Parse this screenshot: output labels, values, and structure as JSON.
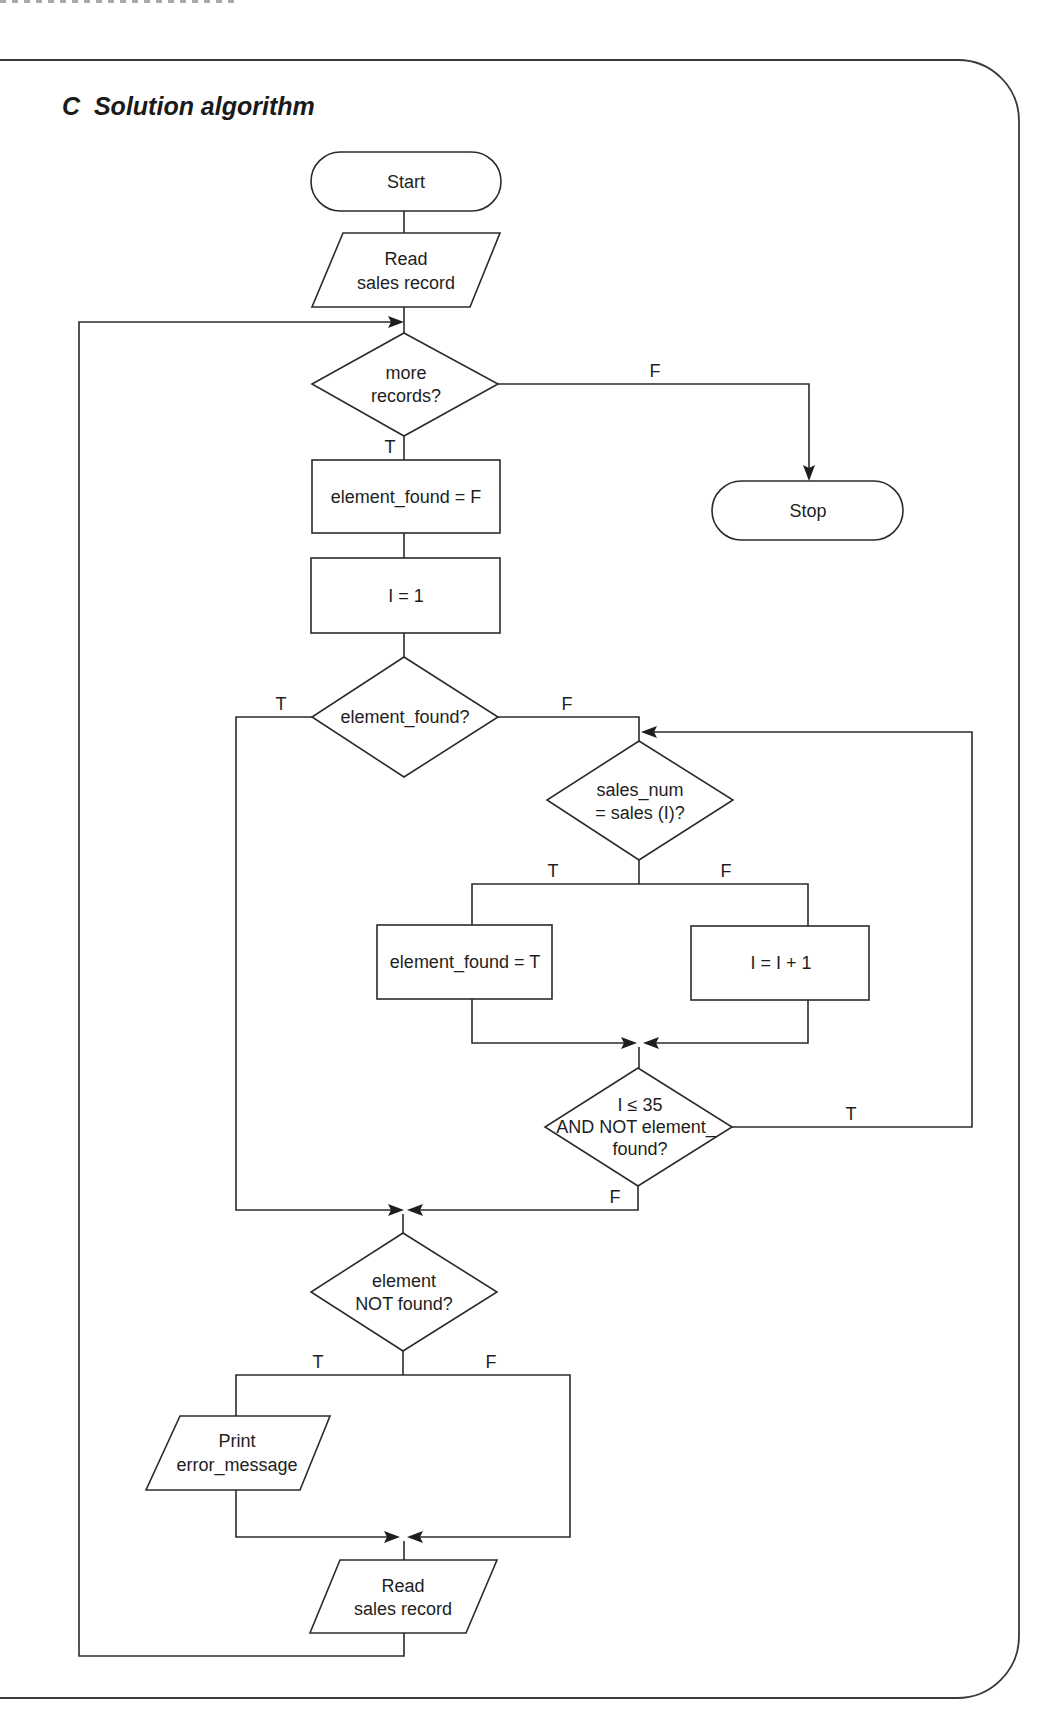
{
  "section": {
    "letter": "C",
    "title": "Solution algorithm",
    "heading": "C  Solution algorithm"
  },
  "flowchart": {
    "nodes": {
      "start": "Start",
      "read1_line1": "Read",
      "read1_line2": "sales record",
      "more_records_line1": "more",
      "more_records_line2": "records?",
      "set_found_f": "element_found = F",
      "stop": "Stop",
      "init_i": "I = 1",
      "element_found_q": "element_found?",
      "compare_line1": "sales_num",
      "compare_line2": "= sales (I)?",
      "set_found_t": "element_found = T",
      "increment_i": "I = I + 1",
      "loop_cond_line1": "I ≤ 35",
      "loop_cond_line2": "AND NOT element_",
      "loop_cond_line3": "found?",
      "not_found_line1": "element",
      "not_found_line2": "NOT found?",
      "print_line1": "Print",
      "print_line2": "error_message",
      "read2_line1": "Read",
      "read2_line2": "sales record"
    },
    "labels": {
      "more_records_false": "F",
      "more_records_true": "T",
      "found_true": "T",
      "found_false": "F",
      "compare_true": "T",
      "compare_false": "F",
      "loop_true": "T",
      "loop_false": "F",
      "not_found_true": "T",
      "not_found_false": "F"
    }
  }
}
